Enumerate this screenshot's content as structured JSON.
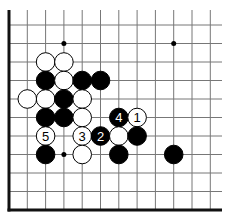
{
  "diagram": {
    "type": "go-board-fragment",
    "grid": {
      "origin_x": 9,
      "origin_y": 25,
      "spacing_x": 18.3,
      "spacing_y": 18.5,
      "cols": 12,
      "rows": 11
    },
    "edges": {
      "left": true,
      "bottom": true,
      "top": false,
      "right": false
    },
    "star_points": [
      [
        3,
        1
      ],
      [
        9,
        1
      ],
      [
        3,
        7
      ]
    ],
    "stones": [
      {
        "col": 2,
        "row": 2,
        "color": "white"
      },
      {
        "col": 3,
        "row": 2,
        "color": "white"
      },
      {
        "col": 2,
        "row": 3,
        "color": "black"
      },
      {
        "col": 3,
        "row": 3,
        "color": "white"
      },
      {
        "col": 4,
        "row": 3,
        "color": "black"
      },
      {
        "col": 5,
        "row": 3,
        "color": "black"
      },
      {
        "col": 1,
        "row": 4,
        "color": "white"
      },
      {
        "col": 2,
        "row": 4,
        "color": "white"
      },
      {
        "col": 3,
        "row": 4,
        "color": "black"
      },
      {
        "col": 4,
        "row": 4,
        "color": "white"
      },
      {
        "col": 2,
        "row": 5,
        "color": "black"
      },
      {
        "col": 3,
        "row": 5,
        "color": "black"
      },
      {
        "col": 4,
        "row": 5,
        "color": "white"
      },
      {
        "col": 6,
        "row": 5,
        "color": "black",
        "label": "4"
      },
      {
        "col": 7,
        "row": 5,
        "color": "white",
        "label": "1"
      },
      {
        "col": 2,
        "row": 6,
        "color": "white",
        "label": "5"
      },
      {
        "col": 4,
        "row": 6,
        "color": "white",
        "label": "3"
      },
      {
        "col": 5,
        "row": 6,
        "color": "black",
        "label": "2"
      },
      {
        "col": 6,
        "row": 6,
        "color": "white"
      },
      {
        "col": 7,
        "row": 6,
        "color": "black"
      },
      {
        "col": 2,
        "row": 7,
        "color": "black"
      },
      {
        "col": 4,
        "row": 7,
        "color": "white"
      },
      {
        "col": 6,
        "row": 7,
        "color": "black"
      },
      {
        "col": 9,
        "row": 7,
        "color": "black"
      }
    ]
  }
}
